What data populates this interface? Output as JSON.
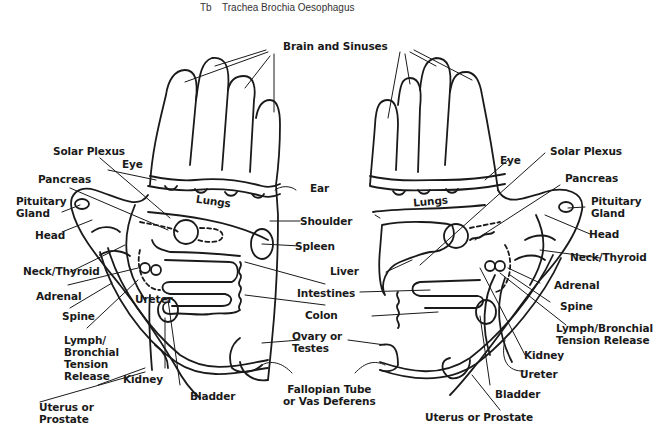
{
  "caption": {
    "code": "Tb",
    "text": "Trachea Brochia Oesophagus"
  },
  "diagram": {
    "center_labels": {
      "brain_sinuses": "Brain and Sinuses",
      "ear": "Ear",
      "shoulder": "Shoulder",
      "spleen": "Spleen",
      "liver": "Liver",
      "intestines": "Intestines",
      "colon": "Colon",
      "ovary_testes": "Ovary or\nTestes",
      "fallopian": "Fallopian Tube\nor Vas Deferens"
    },
    "left_hand": {
      "solar_plexus": "Solar Plexus",
      "eye": "Eye",
      "pancreas": "Pancreas",
      "lungs": "Lungs",
      "pituitary": "Pituitary\nGland",
      "head": "Head",
      "neck_thyroid": "Neck/Thyroid",
      "adrenal": "Adrenal",
      "ureter": "Ureter",
      "spine": "Spine",
      "lymph": "Lymph/\nBronchial\nTension\nRelease",
      "kidney": "Kidney",
      "bladder": "Bladder",
      "uterus": "Uterus or\nProstate"
    },
    "right_hand": {
      "eye": "Eye",
      "solar_plexus": "Solar Plexus",
      "pancreas": "Pancreas",
      "lungs": "Lungs",
      "pituitary": "Pituitary\nGland",
      "head": "Head",
      "neck_thyroid": "Neck/Thyroid",
      "adrenal": "Adrenal",
      "spine": "Spine",
      "lymph": "Lymph/Bronchial\nTension Release",
      "kidney": "Kidney",
      "ureter": "Ureter",
      "bladder": "Bladder",
      "uterus": "Uterus or Prostate"
    }
  }
}
